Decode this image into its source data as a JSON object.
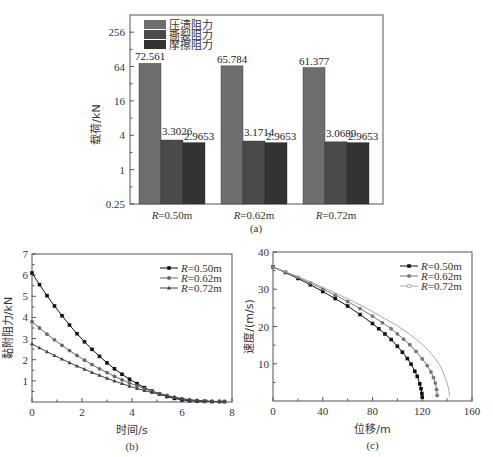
{
  "chart_data": [
    {
      "id": "a",
      "type": "bar",
      "caption": "(a)",
      "title": "",
      "xlabel": "",
      "ylabel": "载荷/kN",
      "yscale": "log2",
      "ylim": [
        0.25,
        512
      ],
      "yticks": [
        {
          "v": 0.25,
          "label": "0.25"
        },
        {
          "v": 1,
          "label": "1"
        },
        {
          "v": 4,
          "label": "4"
        },
        {
          "v": 16,
          "label": "16"
        },
        {
          "v": 64,
          "label": "64"
        },
        {
          "v": 256,
          "label": "256"
        }
      ],
      "categories": [
        "R=0.50m",
        "R=0.62m",
        "R=0.72m"
      ],
      "category_labels": [
        {
          "italic": "R",
          "rest": "=0.50m"
        },
        {
          "italic": "R",
          "rest": "=0.62m"
        },
        {
          "italic": "R",
          "rest": "=0.72m"
        }
      ],
      "series": [
        {
          "name": "压溃阻力",
          "color": "#6e6e6e",
          "values": [
            72.561,
            65.784,
            61.377
          ],
          "labels": [
            "72.561",
            "65.784",
            "61.377"
          ]
        },
        {
          "name": "撕裂阻力",
          "color": "#4a4a4a",
          "values": [
            3.3026,
            3.1714,
            3.0689
          ],
          "labels": [
            "3.3026",
            "3.1714",
            "3.0689"
          ]
        },
        {
          "name": "摩擦阻力",
          "color": "#333333",
          "values": [
            2.9653,
            2.9653,
            2.9653
          ],
          "labels": [
            "2.9653",
            "2.9653",
            "2.9653"
          ]
        }
      ],
      "legend_position": "upper-left",
      "grid": false
    },
    {
      "id": "b",
      "type": "line",
      "caption": "(b)",
      "xlabel": "时间/s",
      "ylabel": "黏附阻力/kN",
      "xlim": [
        0,
        8
      ],
      "ylim": [
        0,
        7
      ],
      "xticks": [
        0,
        2,
        4,
        6,
        8
      ],
      "yticks": [
        1,
        2,
        3,
        4,
        5,
        6,
        7
      ],
      "legend_position": "upper-right",
      "grid": false,
      "series": [
        {
          "name": "R=0.50m",
          "legend_italic": "R",
          "legend_rest": "=0.50m",
          "marker": "square",
          "color": "#111111",
          "x": [
            0,
            0.3,
            0.6,
            0.9,
            1.2,
            1.5,
            1.8,
            2.1,
            2.4,
            2.7,
            3.0,
            3.3,
            3.6,
            3.9,
            4.2,
            4.5,
            4.8,
            5.1,
            5.4,
            5.7,
            6.0,
            6.3,
            6.6,
            6.9,
            7.2,
            7.5,
            7.7
          ],
          "y": [
            6.1,
            5.55,
            5.03,
            4.54,
            4.08,
            3.64,
            3.23,
            2.85,
            2.49,
            2.16,
            1.85,
            1.57,
            1.31,
            1.08,
            0.87,
            0.68,
            0.52,
            0.38,
            0.26,
            0.17,
            0.1,
            0.06,
            0.04,
            0.03,
            0.02,
            0.02,
            0.02
          ]
        },
        {
          "name": "R=0.62m",
          "legend_italic": "R",
          "legend_rest": "=0.62m",
          "marker": "circle",
          "color": "#666666",
          "x": [
            0,
            0.3,
            0.6,
            0.9,
            1.2,
            1.5,
            1.8,
            2.1,
            2.4,
            2.7,
            3.0,
            3.3,
            3.6,
            3.9,
            4.2,
            4.5,
            4.8,
            5.1,
            5.4,
            5.7,
            6.0,
            6.3,
            6.6,
            6.9,
            7.2,
            7.5,
            7.7
          ],
          "y": [
            3.8,
            3.5,
            3.21,
            2.94,
            2.68,
            2.43,
            2.2,
            1.98,
            1.77,
            1.57,
            1.39,
            1.21,
            1.05,
            0.9,
            0.76,
            0.63,
            0.51,
            0.4,
            0.31,
            0.23,
            0.16,
            0.11,
            0.07,
            0.05,
            0.03,
            0.03,
            0.02
          ]
        },
        {
          "name": "R=0.72m",
          "legend_italic": "R",
          "legend_rest": "=0.72m",
          "marker": "triangle",
          "color": "#444444",
          "x": [
            0,
            0.3,
            0.6,
            0.9,
            1.2,
            1.5,
            1.8,
            2.1,
            2.4,
            2.7,
            3.0,
            3.3,
            3.6,
            3.9,
            4.2,
            4.5,
            4.8,
            5.1,
            5.4,
            5.7,
            6.0,
            6.3,
            6.6,
            6.9,
            7.2,
            7.5,
            7.7
          ],
          "y": [
            2.75,
            2.56,
            2.38,
            2.2,
            2.03,
            1.86,
            1.7,
            1.55,
            1.4,
            1.26,
            1.12,
            0.99,
            0.87,
            0.75,
            0.64,
            0.54,
            0.45,
            0.36,
            0.28,
            0.21,
            0.15,
            0.1,
            0.07,
            0.05,
            0.03,
            0.02,
            0.02
          ]
        }
      ]
    },
    {
      "id": "c",
      "type": "line",
      "caption": "(c)",
      "xlabel": "位移/m",
      "ylabel": "速度/(m/s)",
      "xlim": [
        0,
        160
      ],
      "ylim": [
        0,
        40
      ],
      "xticks": [
        0,
        40,
        80,
        120,
        160
      ],
      "yticks": [
        10,
        20,
        30,
        40
      ],
      "legend_position": "upper-right",
      "grid": false,
      "series": [
        {
          "name": "R=0.50m",
          "legend_italic": "R",
          "legend_rest": "=0.50m",
          "marker": "square",
          "color": "#111111",
          "x": [
            0,
            10,
            20,
            30,
            40,
            50,
            60,
            70,
            80,
            85,
            90,
            95,
            100,
            104,
            108,
            111,
            114,
            116,
            118,
            119,
            119.7,
            120
          ],
          "y": [
            36.0,
            34.5,
            32.9,
            31.2,
            29.4,
            27.5,
            25.5,
            23.2,
            20.8,
            19.4,
            18.0,
            16.5,
            14.7,
            13.1,
            11.4,
            9.9,
            8.0,
            6.6,
            4.6,
            3.3,
            2.0,
            1.0
          ]
        },
        {
          "name": "R=0.62m",
          "legend_italic": "R",
          "legend_rest": "=0.62m",
          "marker": "circle",
          "color": "#777777",
          "x": [
            0,
            10,
            20,
            30,
            40,
            50,
            60,
            70,
            80,
            88,
            95,
            100,
            105,
            110,
            115,
            120,
            124,
            127,
            129,
            130.5,
            131.5,
            132
          ],
          "y": [
            36.0,
            34.6,
            33.2,
            31.7,
            30.1,
            28.4,
            26.7,
            24.8,
            22.8,
            21.0,
            19.4,
            18.0,
            16.6,
            15.1,
            13.3,
            11.3,
            9.5,
            7.8,
            6.3,
            4.8,
            3.1,
            1.5
          ]
        },
        {
          "name": "R=0.72m",
          "legend_italic": "R",
          "legend_rest": "=0.72m",
          "marker": "none",
          "color": "#aaaaaa",
          "x": [
            0,
            10,
            20,
            30,
            40,
            50,
            60,
            70,
            80,
            90,
            100,
            110,
            115,
            120,
            125,
            130,
            134,
            137,
            139,
            140.5,
            141.5,
            142
          ],
          "y": [
            36.0,
            34.7,
            33.4,
            32.0,
            30.5,
            29.0,
            27.4,
            25.8,
            24.0,
            22.1,
            20.2,
            17.9,
            16.6,
            15.2,
            13.6,
            11.6,
            9.6,
            7.6,
            5.8,
            4.3,
            2.7,
            1.2
          ]
        }
      ]
    }
  ]
}
